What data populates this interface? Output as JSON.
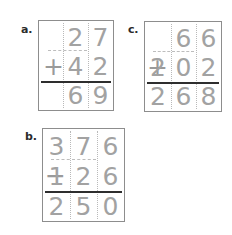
{
  "worksheet": {
    "type": "math-worksheet",
    "description": "Three column-method arithmetic problems in boxed grids",
    "digit_color": "#a2a2a2",
    "box_border_color": "#8d8d8d",
    "answer_bar_color": "#2e2e2e",
    "grid_line_color": "#b9b9b9",
    "label_color": "#2b2b2b"
  },
  "problems": [
    {
      "label": "a.",
      "operation": "+",
      "operator_symbol": "+",
      "columns": 3,
      "operand_1": [
        "",
        "2",
        "7"
      ],
      "operand_2": [
        "",
        "4",
        "2"
      ],
      "answer": [
        "",
        "6",
        "9"
      ],
      "operand_1_value": "27",
      "operand_2_value": "42",
      "answer_value": "69",
      "expression": "27 + 42 = 69"
    },
    {
      "label": "b.",
      "operation": "-",
      "operator_symbol": "−",
      "columns": 3,
      "operand_1": [
        "3",
        "7",
        "6"
      ],
      "operand_2": [
        "1",
        "2",
        "6"
      ],
      "answer": [
        "2",
        "5",
        "0"
      ],
      "operand_1_value": "376",
      "operand_2_value": "126",
      "answer_value": "250",
      "expression": "376 − 126 = 250"
    },
    {
      "label": "c.",
      "operation": "+",
      "operator_symbol": "+",
      "columns": 3,
      "operand_1": [
        "",
        "6",
        "6"
      ],
      "operand_2": [
        "2",
        "0",
        "2"
      ],
      "answer": [
        "2",
        "6",
        "8"
      ],
      "operand_1_value": "66",
      "operand_2_value": "202",
      "answer_value": "268",
      "expression": "66 + 202 = 268"
    }
  ]
}
